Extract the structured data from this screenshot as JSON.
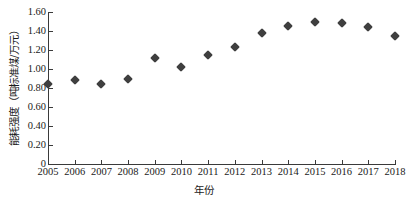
{
  "chart_data": {
    "type": "scatter",
    "title": "",
    "xlabel": "年份",
    "ylabel": "能耗强度（吨标准煤/万元）",
    "categories": [
      2005,
      2006,
      2007,
      2008,
      2009,
      2010,
      2011,
      2012,
      2013,
      2014,
      2015,
      2016,
      2017,
      2018
    ],
    "x": [
      2005,
      2006,
      2007,
      2008,
      2009,
      2010,
      2011,
      2012,
      2013,
      2014,
      2015,
      2016,
      2017,
      2018
    ],
    "values": [
      0.84,
      0.88,
      0.84,
      0.9,
      1.12,
      1.02,
      1.15,
      1.23,
      1.38,
      1.45,
      1.5,
      1.48,
      1.44,
      1.35
    ],
    "series": [
      {
        "name": "能耗强度",
        "values": [
          0.84,
          0.88,
          0.84,
          0.9,
          1.12,
          1.02,
          1.15,
          1.23,
          1.38,
          1.45,
          1.5,
          1.48,
          1.44,
          1.35
        ]
      }
    ],
    "xlim": [
      2005,
      2018
    ],
    "ylim": [
      0,
      1.6
    ],
    "ytick_labels": [
      "0",
      "0.20",
      "0.40",
      "0.60",
      "0.80",
      "1.00",
      "1.20",
      "1.40",
      "1.60"
    ],
    "ytick_values": [
      0,
      0.2,
      0.4,
      0.6,
      0.8,
      1.0,
      1.2,
      1.4,
      1.6
    ],
    "xtick_labels": [
      "2005",
      "2006",
      "2007",
      "2008",
      "2009",
      "2010",
      "2011",
      "2012",
      "2013",
      "2014",
      "2015",
      "2016",
      "2017",
      "2018"
    ],
    "grid": false,
    "legend": "none",
    "marker": "diamond",
    "marker_color": "#3f3f3f",
    "axis_color": "#3a3a3a"
  }
}
